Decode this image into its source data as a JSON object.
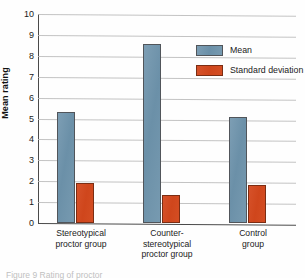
{
  "figure": {
    "caption": "Figure 9  Rating of proctor"
  },
  "chart_data": {
    "type": "bar",
    "title": "",
    "xlabel": "",
    "ylabel": "Mean rating",
    "ylim": [
      0,
      10
    ],
    "ytick_labels": [
      "10",
      "9",
      "8",
      "7",
      "6",
      "5",
      "4",
      "3",
      "2",
      "1",
      "0"
    ],
    "yticks": [
      10,
      9,
      8,
      7,
      6,
      5,
      4,
      3,
      2,
      1,
      0
    ],
    "grid": true,
    "legend_position": "top-right",
    "categories": [
      "Stereotypical proctor group",
      "Counter-stereotypical proctor group",
      "Control group"
    ],
    "category_lines": [
      [
        "Stereotypical",
        "proctor group"
      ],
      [
        "Counter-",
        "stereotypical",
        "proctor group"
      ],
      [
        "Control",
        "group"
      ]
    ],
    "series": [
      {
        "name": "Mean",
        "color": "#6f94ab",
        "values": [
          5.3,
          8.55,
          5.05
        ]
      },
      {
        "name": "Standard deviation",
        "color": "#d2491f",
        "values": [
          1.9,
          1.35,
          1.8
        ]
      }
    ]
  }
}
